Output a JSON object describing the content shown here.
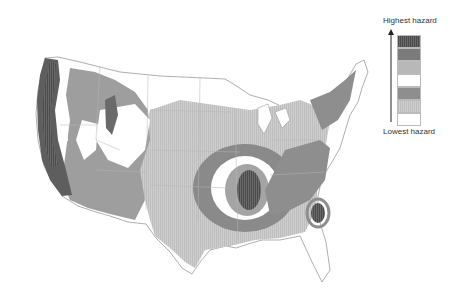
{
  "map": {
    "subject": "Seismic hazard map of the contiguous United States",
    "colors": {
      "land_white": "#ffffff",
      "border": "#9a9a9a",
      "band_light": "#d2d2d2",
      "band_mid": "#a6a6a6",
      "band_dark": "#7a7a7a",
      "band_darker": "#5e5e5e",
      "band_darkest": "#444444"
    }
  },
  "legend": {
    "top_label": "Highest hazard",
    "bottom_label": "Lowest hazard",
    "swatches": [
      {
        "level": 7,
        "color": "#555555",
        "hatched": true
      },
      {
        "level": 6,
        "color": "#7b7b7b",
        "hatched": false
      },
      {
        "level": 5,
        "color": "#b8b8b8",
        "hatched": false
      },
      {
        "level": 4,
        "color": "#ffffff",
        "hatched": false
      },
      {
        "level": 3,
        "color": "#8e8e8e",
        "hatched": false
      },
      {
        "level": 2,
        "color": "#c9c9c9",
        "hatched": true
      },
      {
        "level": 1,
        "color": "#ffffff",
        "hatched": false
      }
    ]
  }
}
